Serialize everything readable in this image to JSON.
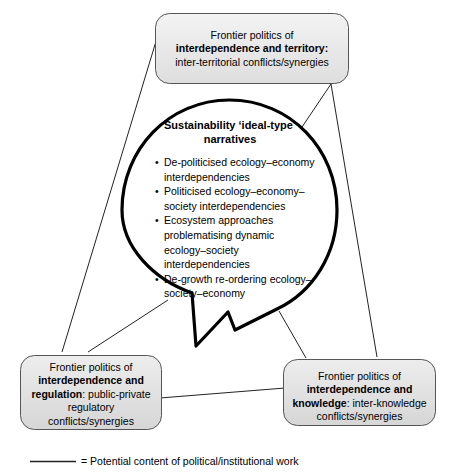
{
  "diagram": {
    "colors": {
      "box_fill_top": "#f0f0f0",
      "box_fill_bottom": "#dcdcdc",
      "box_border": "#555555",
      "connector": "#222222",
      "bubble_border": "#000000",
      "text": "#000000"
    },
    "top_box": {
      "line1": "Frontier politics of",
      "line2_bold": "interdependence and territory:",
      "line3": "inter-territorial conflicts/synergies"
    },
    "bottom_left_box": {
      "line1": "Frontier politics of",
      "line2_bold": "interdependence and",
      "line3_bold": "regulation",
      "line3_rest": ": public-private",
      "line4": "regulatory",
      "line5": "conflicts/synergies"
    },
    "bottom_right_box": {
      "line1": "Frontier politics of",
      "line2_bold": "interdependence and",
      "line3_bold": "knowledge",
      "line3_rest": ": inter-knowledge",
      "line4": "conflicts/synergies"
    },
    "bubble": {
      "title_line1": "Sustainability ‘ideal-type’",
      "title_line2": "narratives",
      "bullet_char": "•",
      "items": [
        "De-politicised ecology–economy interdependencies",
        "Politicised ecology–economy–society interdependencies",
        "Ecosystem approaches problematising dynamic ecology–society interdependencies",
        "De-growth re-ordering ecology–society–economy"
      ]
    },
    "legend": {
      "equals": "=",
      "label": "= Potential content of political/institutional work"
    }
  }
}
